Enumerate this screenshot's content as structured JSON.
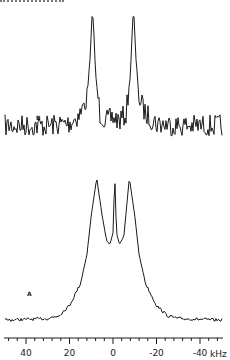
{
  "chart_data": [
    {
      "type": "line",
      "panel": "B",
      "title": "",
      "xlabel": "kHz",
      "ylabel": "",
      "xlim": [
        50,
        -50
      ],
      "x_reversed": true,
      "description": "Noisy doublet spectrum with two sharp horn peaks at about ±9.5 kHz, each with a small shoulder split; small ripple between peaks",
      "peaks_kHz": [
        9.5,
        -9.5
      ],
      "baseline_noise": "high",
      "series": [
        {
          "name": "B",
          "x": [
            48,
            30,
            20,
            15,
            12,
            10.5,
            9.5,
            9,
            8,
            6,
            3,
            0,
            -3,
            -6,
            -8,
            -9,
            -9.5,
            -10.5,
            -12,
            -15,
            -20,
            -30,
            -50
          ],
          "y": [
            0.02,
            0.02,
            0.04,
            0.12,
            0.25,
            0.6,
            1.0,
            0.9,
            0.45,
            0.12,
            0.06,
            0.09,
            0.06,
            0.12,
            0.45,
            0.9,
            1.0,
            0.6,
            0.25,
            0.12,
            0.04,
            0.02,
            0.02
          ]
        }
      ]
    },
    {
      "type": "line",
      "panel": "A",
      "title": "",
      "xlabel": "kHz",
      "ylabel": "",
      "xlim": [
        50,
        -50
      ],
      "x_reversed": true,
      "description": "Broad powder-pattern line with two horns at about ±7.5 kHz and a sharp central spike near 0 kHz; broad wings to ±25 kHz",
      "peaks_kHz": [
        7.5,
        -0.8,
        -7.5
      ],
      "series": [
        {
          "name": "A",
          "x": [
            48,
            30,
            25,
            20,
            15,
            12,
            10,
            7.5,
            5,
            3,
            1.5,
            0,
            -0.8,
            -1.6,
            -3,
            -5,
            -7.5,
            -10,
            -12,
            -15,
            -20,
            -25,
            -30,
            -48
          ],
          "y": [
            0.0,
            0.01,
            0.03,
            0.1,
            0.25,
            0.45,
            0.72,
            0.98,
            0.72,
            0.55,
            0.52,
            0.6,
            1.0,
            0.6,
            0.52,
            0.58,
            0.98,
            0.72,
            0.45,
            0.25,
            0.1,
            0.03,
            0.01,
            0.0
          ]
        }
      ]
    }
  ],
  "axis": {
    "ticks": [
      {
        "value": 40,
        "label": "40"
      },
      {
        "value": 20,
        "label": "20"
      },
      {
        "value": 0,
        "label": "0"
      },
      {
        "value": -20,
        "label": "-20"
      },
      {
        "value": -40,
        "label": "-40"
      }
    ],
    "minor_step_kHz": 4,
    "unit": "kHz"
  },
  "labels": {
    "panel_b": "B",
    "panel_a": "A",
    "unit": "kHz"
  }
}
